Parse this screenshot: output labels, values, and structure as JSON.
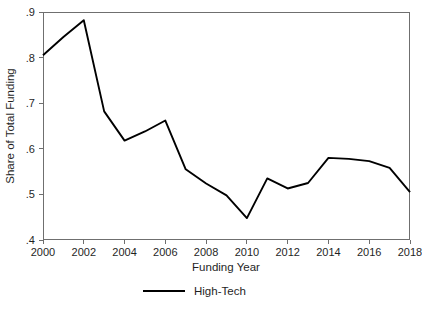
{
  "chart_data": {
    "type": "line",
    "title": "",
    "xlabel": "Funding Year",
    "ylabel": "Share of Total Funding",
    "xlim": [
      2000,
      2018
    ],
    "ylim": [
      0.4,
      0.9
    ],
    "grid": false,
    "legend_position": "bottom-center",
    "x": [
      2000,
      2001,
      2002,
      2003,
      2004,
      2005,
      2006,
      2007,
      2008,
      2009,
      2010,
      2011,
      2012,
      2013,
      2014,
      2015,
      2016,
      2017,
      2018
    ],
    "series": [
      {
        "name": "High-Tech",
        "color": "#000000",
        "values": [
          0.805,
          0.845,
          0.882,
          0.682,
          0.618,
          0.638,
          0.662,
          0.555,
          0.524,
          0.498,
          0.448,
          0.535,
          0.513,
          0.525,
          0.58,
          0.578,
          0.573,
          0.558,
          0.505
        ]
      }
    ],
    "x_tick_values": [
      2000,
      2002,
      2004,
      2006,
      2008,
      2010,
      2012,
      2014,
      2016,
      2018
    ],
    "x_tick_labels": [
      "2000",
      "2002",
      "2004",
      "2006",
      "2008",
      "2010",
      "2012",
      "2014",
      "2016",
      "2018"
    ],
    "y_tick_values": [
      0.4,
      0.5,
      0.6,
      0.7,
      0.8,
      0.9
    ],
    "y_tick_labels": [
      ".4",
      ".5",
      ".6",
      ".7",
      ".8",
      ".9"
    ],
    "legend_entries": [
      "High-Tech"
    ]
  },
  "axes": {
    "x_title": "Funding Year",
    "y_title": "Share of Total Funding"
  },
  "legend": {
    "items": [
      {
        "label": "High-Tech"
      }
    ]
  },
  "colors": {
    "series": "#000000",
    "frame": "#6f6f6f",
    "background": "#ffffff",
    "text": "#1f1f1f"
  }
}
